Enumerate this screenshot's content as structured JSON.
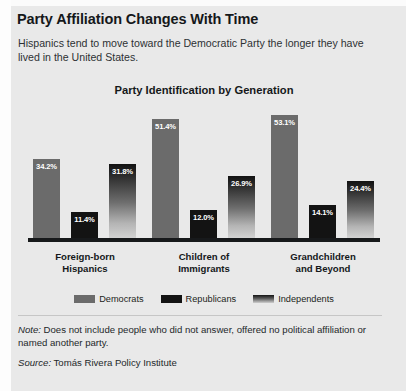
{
  "headline": "Party Affiliation Changes With Time",
  "deck": "Hispanics tend to move toward the Democratic Party the longer they have lived in the United States.",
  "note": {
    "lead": "Note:",
    "text": " Does not include people who did not answer, offered no political affiliation or named another party."
  },
  "source": {
    "lead": "Source:",
    "text": " Tomás Rivera Policy Institute"
  },
  "colors": {
    "democrats": "#6b6b6b",
    "republicans": "#131313",
    "independents": "#5c5c5c",
    "background": "#e9e9e9",
    "axis": "#17191b",
    "label_text": "#ffffff"
  },
  "chart_data": {
    "type": "bar",
    "title": "Party Identification by Generation",
    "xlabel": "",
    "ylabel": "",
    "ylim": [
      0,
      60
    ],
    "grid": false,
    "legend_position": "bottom",
    "categories": [
      "Foreign-born Hispanics",
      "Children of Immigrants",
      "Grandchildren and Beyond"
    ],
    "category_lines": [
      [
        "Foreign-born",
        "Hispanics"
      ],
      [
        "Children of",
        "Immigrants"
      ],
      [
        "Grandchildren",
        "and Beyond"
      ]
    ],
    "series": [
      {
        "name": "Democrats",
        "values": [
          34.2,
          51.4,
          53.1
        ],
        "labels": [
          "34.2%",
          "51.4%",
          "53.1%"
        ]
      },
      {
        "name": "Republicans",
        "values": [
          11.4,
          12.0,
          14.1
        ],
        "labels": [
          "11.4%",
          "12.0%",
          "14.1%"
        ]
      },
      {
        "name": "Independents",
        "values": [
          31.8,
          26.9,
          24.4
        ],
        "labels": [
          "31.8%",
          "26.9%",
          "24.4%"
        ]
      }
    ]
  }
}
